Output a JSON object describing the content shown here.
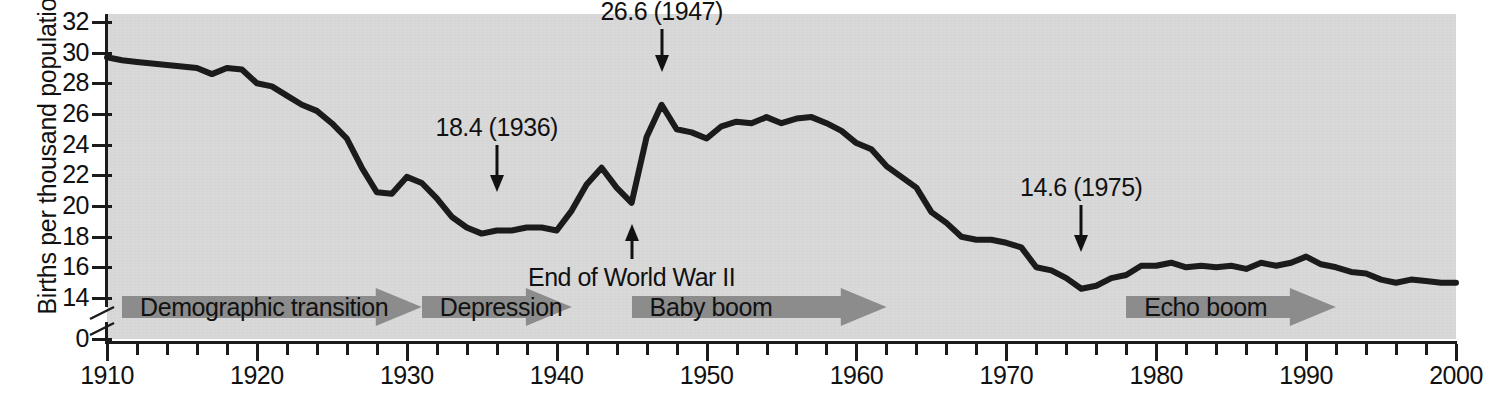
{
  "chart_data": {
    "type": "line",
    "title": "",
    "xlabel": "",
    "ylabel": "Births per thousand population",
    "xlim": [
      1910,
      2000
    ],
    "ylim": [
      14,
      32
    ],
    "y_axis_break": true,
    "y_axis_break_base": "0",
    "grid": false,
    "legend": null,
    "y_ticks": [
      32,
      30,
      28,
      26,
      24,
      22,
      20,
      18,
      16,
      14,
      0
    ],
    "x_ticks": [
      1910,
      1920,
      1930,
      1940,
      1950,
      1960,
      1970,
      1980,
      1990,
      2000
    ],
    "x_minor_tick_step": 2,
    "series": [
      {
        "name": "US birth rate",
        "color": "#1b1b1b",
        "x": [
          1910,
          1911,
          1912,
          1913,
          1914,
          1915,
          1916,
          1917,
          1918,
          1919,
          1920,
          1921,
          1922,
          1923,
          1924,
          1925,
          1926,
          1927,
          1928,
          1929,
          1930,
          1931,
          1932,
          1933,
          1934,
          1935,
          1936,
          1937,
          1938,
          1939,
          1940,
          1941,
          1942,
          1943,
          1944,
          1945,
          1946,
          1947,
          1948,
          1949,
          1950,
          1951,
          1952,
          1953,
          1954,
          1955,
          1956,
          1957,
          1958,
          1959,
          1960,
          1961,
          1962,
          1963,
          1964,
          1965,
          1966,
          1967,
          1968,
          1969,
          1970,
          1971,
          1972,
          1973,
          1974,
          1975,
          1976,
          1977,
          1978,
          1979,
          1980,
          1981,
          1982,
          1983,
          1984,
          1985,
          1986,
          1987,
          1988,
          1989,
          1990,
          1991,
          1992,
          1993,
          1994,
          1995,
          1996,
          1997,
          1998,
          1999,
          2000
        ],
        "y": [
          29.7,
          29.5,
          29.4,
          29.3,
          29.2,
          29.1,
          29.0,
          28.6,
          29.0,
          28.9,
          28.0,
          27.8,
          27.2,
          26.6,
          26.2,
          25.4,
          24.4,
          22.5,
          20.9,
          20.8,
          21.9,
          21.5,
          20.5,
          19.3,
          18.6,
          18.2,
          18.4,
          18.4,
          18.6,
          18.6,
          18.4,
          19.7,
          21.4,
          22.5,
          21.2,
          20.2,
          24.5,
          26.6,
          25.0,
          24.8,
          24.4,
          25.2,
          25.5,
          25.4,
          25.8,
          25.4,
          25.7,
          25.8,
          25.4,
          24.9,
          24.1,
          23.7,
          22.6,
          21.9,
          21.2,
          19.6,
          18.9,
          18.0,
          17.8,
          17.8,
          17.6,
          17.3,
          16.0,
          15.8,
          15.3,
          14.6,
          14.8,
          15.3,
          15.5,
          16.1,
          16.1,
          16.3,
          16.0,
          16.1,
          16.0,
          16.1,
          15.9,
          16.3,
          16.1,
          16.3,
          16.7,
          16.2,
          16.0,
          15.7,
          15.6,
          15.2,
          15.0,
          15.2,
          15.1,
          15.0,
          15.0
        ]
      }
    ],
    "annotations": [
      {
        "text": "26.6 (1947)",
        "year": 1947,
        "value": 26.6,
        "direction": "down"
      },
      {
        "text": "18.4 (1936)",
        "year": 1936,
        "value": 18.4,
        "direction": "down"
      },
      {
        "text": "14.6 (1975)",
        "year": 1975,
        "value": 14.6,
        "direction": "down"
      },
      {
        "text": "End of World War II",
        "year": 1945,
        "value": 20.2,
        "direction": "up"
      }
    ],
    "era_bands": [
      {
        "label": "Demographic transition",
        "start_year": 1911,
        "end_year": 1931
      },
      {
        "label": "Depression",
        "start_year": 1931,
        "end_year": 1941
      },
      {
        "label": "Baby boom",
        "start_year": 1945,
        "end_year": 1962
      },
      {
        "label": "Echo boom",
        "start_year": 1978,
        "end_year": 1992
      }
    ]
  },
  "axis": {
    "y_title": "Births per thousand population",
    "y_labels": [
      "32",
      "30",
      "28",
      "26",
      "24",
      "22",
      "20",
      "18",
      "16",
      "14",
      "0"
    ],
    "x_labels": [
      "1910",
      "1920",
      "1930",
      "1940",
      "1950",
      "1960",
      "1970",
      "1980",
      "1990",
      "2000"
    ]
  },
  "annotations": {
    "peak_1947": "26.6 (1947)",
    "trough_1936": "18.4 (1936)",
    "trough_1975": "14.6 (1975)",
    "wwii": "End of World War II"
  },
  "eras": {
    "demographic_transition": "Demographic transition",
    "depression": "Depression",
    "baby_boom": "Baby boom",
    "echo_boom": "Echo boom"
  },
  "colors": {
    "plot_background": "#d9d9d9",
    "line": "#1b1b1b",
    "band": "#8c8c8c",
    "text": "#111111"
  }
}
